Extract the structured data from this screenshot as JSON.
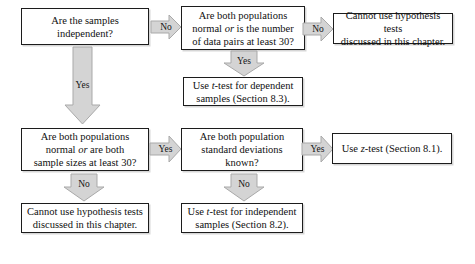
{
  "diagram": {
    "background_color": "#ffffff",
    "box_border_color": "#1c1c1c",
    "arrow_fill_color": "#d4d4d4",
    "arrow_edge_color": "#a8a8a8",
    "text_color": "#101010"
  },
  "nodes": {
    "samples_independent": {
      "text": "Are the samples\nindependent?",
      "kind": "decision"
    },
    "paired_normal_or_30": {
      "text": "Are both populations\nnormal or is the number\nof data pairs at least 30?",
      "kind": "decision"
    },
    "cannot_use_paired": {
      "text": "Cannot use hypothesis tests\ndiscussed in this chapter.",
      "kind": "terminal"
    },
    "t_test_dependent": {
      "text": "Use t-test for dependent\nsamples (Section 8.3).",
      "kind": "terminal"
    },
    "indep_normal_or_30": {
      "text": "Are both populations\nnormal or are both\nsample sizes at least 30?",
      "kind": "decision"
    },
    "sigmas_known": {
      "text": "Are both population\nstandard deviations\nknown?",
      "kind": "decision"
    },
    "z_test": {
      "text": "Use z-test (Section 8.1).",
      "kind": "terminal"
    },
    "cannot_use_indep": {
      "text": "Cannot use hypothesis tests\ndiscussed in this chapter.",
      "kind": "terminal"
    },
    "t_test_independent": {
      "text": "Use t-test for independent\nsamples (Section 8.2).",
      "kind": "terminal"
    }
  },
  "arrows": {
    "samples_independent_no": {
      "label": "No",
      "direction": "right"
    },
    "samples_independent_yes": {
      "label": "Yes",
      "direction": "down"
    },
    "paired_normal_no": {
      "label": "No",
      "direction": "right"
    },
    "paired_normal_yes": {
      "label": "Yes",
      "direction": "down"
    },
    "indep_normal_yes": {
      "label": "Yes",
      "direction": "right"
    },
    "indep_normal_no": {
      "label": "No",
      "direction": "down"
    },
    "sigmas_known_yes": {
      "label": "Yes",
      "direction": "right"
    },
    "sigmas_known_no": {
      "label": "No",
      "direction": "down"
    }
  }
}
